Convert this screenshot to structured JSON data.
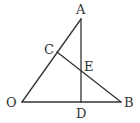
{
  "diagram": {
    "type": "geometry-figure",
    "stroke_color": "#333333",
    "background": "#ffffff",
    "points": {
      "A": {
        "label": "A",
        "x": 81,
        "y": 19,
        "label_x": 76,
        "label_y": 14
      },
      "O": {
        "label": "O",
        "x": 22,
        "y": 102,
        "label_x": 6,
        "label_y": 107
      },
      "B": {
        "label": "B",
        "x": 121,
        "y": 102,
        "label_x": 124,
        "label_y": 107
      },
      "C": {
        "label": "C",
        "x": 57,
        "y": 52,
        "label_x": 44,
        "label_y": 54
      },
      "D": {
        "label": "D",
        "x": 81,
        "y": 102,
        "label_x": 76,
        "label_y": 118
      },
      "E": {
        "label": "E",
        "x": 81,
        "y": 71,
        "label_x": 84,
        "label_y": 71
      }
    },
    "segments": [
      {
        "name": "OA",
        "from": "O",
        "to": "A"
      },
      {
        "name": "OB",
        "from": "O",
        "to": "B"
      },
      {
        "name": "AD",
        "from": "A",
        "to": "D"
      },
      {
        "name": "CB",
        "from": "C",
        "to": "B"
      }
    ]
  }
}
